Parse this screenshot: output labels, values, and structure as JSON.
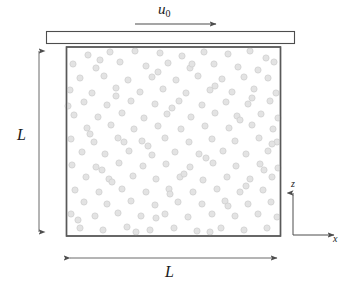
{
  "figure": {
    "labels": {
      "velocity_symbol": "u",
      "velocity_subscript": "0",
      "height_label": "L",
      "width_label": "L",
      "z_axis_label": "z",
      "x_axis_label": "x"
    },
    "colors": {
      "line": "#4d4d4d",
      "box_border": "#595959",
      "plate_border": "#4d4d4d",
      "plate_fill": "#ffffff",
      "particle_fill": "#e3e3e3",
      "particle_stroke": "#cfcfcf",
      "background": "#ffffff",
      "text": "#1a1a1a"
    },
    "geometry": {
      "box": {
        "x": 66,
        "y": 47,
        "width": 215,
        "height": 189
      },
      "plate": {
        "x": 46,
        "y": 31,
        "width": 249,
        "height": 13
      },
      "velocity_arrow": {
        "x1": 135,
        "y1": 24,
        "x2": 219,
        "y2": 24
      },
      "height_dimension": {
        "x": 39,
        "y1": 47,
        "y2": 236
      },
      "width_dimension": {
        "y": 258,
        "x1": 66,
        "x2": 281
      },
      "axes_origin": {
        "x": 293,
        "y": 235
      },
      "axes_z_tip": {
        "x": 293,
        "y": 190
      },
      "axes_x_tip": {
        "x": 337,
        "y": 235
      }
    },
    "particles": {
      "radius": 3.1,
      "count": 168,
      "points": [
        [
          88,
          55
        ],
        [
          110,
          52
        ],
        [
          135,
          51
        ],
        [
          160,
          53
        ],
        [
          182,
          56
        ],
        [
          204,
          52
        ],
        [
          228,
          54
        ],
        [
          250,
          51
        ],
        [
          266,
          58
        ],
        [
          73,
          64
        ],
        [
          96,
          68
        ],
        [
          120,
          62
        ],
        [
          146,
          66
        ],
        [
          168,
          63
        ],
        [
          190,
          68
        ],
        [
          214,
          64
        ],
        [
          238,
          67
        ],
        [
          258,
          70
        ],
        [
          274,
          62
        ],
        [
          80,
          78
        ],
        [
          104,
          76
        ],
        [
          128,
          80
        ],
        [
          152,
          77
        ],
        [
          176,
          80
        ],
        [
          198,
          76
        ],
        [
          222,
          79
        ],
        [
          244,
          77
        ],
        [
          268,
          78
        ],
        [
          70,
          90
        ],
        [
          92,
          93
        ],
        [
          116,
          88
        ],
        [
          140,
          92
        ],
        [
          163,
          89
        ],
        [
          186,
          93
        ],
        [
          210,
          90
        ],
        [
          232,
          92
        ],
        [
          254,
          89
        ],
        [
          276,
          93
        ],
        [
          84,
          102
        ],
        [
          107,
          105
        ],
        [
          131,
          101
        ],
        [
          155,
          104
        ],
        [
          179,
          101
        ],
        [
          202,
          105
        ],
        [
          226,
          102
        ],
        [
          248,
          104
        ],
        [
          270,
          101
        ],
        [
          74,
          115
        ],
        [
          98,
          117
        ],
        [
          122,
          113
        ],
        [
          144,
          118
        ],
        [
          167,
          114
        ],
        [
          191,
          117
        ],
        [
          215,
          113
        ],
        [
          237,
          116
        ],
        [
          261,
          114
        ],
        [
          278,
          118
        ],
        [
          87,
          128
        ],
        [
          111,
          125
        ],
        [
          134,
          129
        ],
        [
          158,
          126
        ],
        [
          181,
          129
        ],
        [
          205,
          126
        ],
        [
          229,
          128
        ],
        [
          252,
          125
        ],
        [
          273,
          129
        ],
        [
          71,
          139
        ],
        [
          94,
          142
        ],
        [
          118,
          138
        ],
        [
          142,
          141
        ],
        [
          165,
          138
        ],
        [
          189,
          142
        ],
        [
          212,
          139
        ],
        [
          235,
          141
        ],
        [
          259,
          138
        ],
        [
          277,
          142
        ],
        [
          82,
          152
        ],
        [
          105,
          154
        ],
        [
          129,
          151
        ],
        [
          152,
          155
        ],
        [
          175,
          152
        ],
        [
          199,
          154
        ],
        [
          223,
          151
        ],
        [
          246,
          154
        ],
        [
          268,
          151
        ],
        [
          72,
          165
        ],
        [
          96,
          167
        ],
        [
          119,
          163
        ],
        [
          143,
          166
        ],
        [
          166,
          164
        ],
        [
          190,
          167
        ],
        [
          213,
          163
        ],
        [
          236,
          166
        ],
        [
          260,
          164
        ],
        [
          278,
          168
        ],
        [
          86,
          177
        ],
        [
          109,
          179
        ],
        [
          133,
          176
        ],
        [
          156,
          179
        ],
        [
          180,
          177
        ],
        [
          203,
          180
        ],
        [
          227,
          177
        ],
        [
          250,
          179
        ],
        [
          272,
          177
        ],
        [
          75,
          190
        ],
        [
          99,
          192
        ],
        [
          122,
          189
        ],
        [
          146,
          192
        ],
        [
          169,
          189
        ],
        [
          193,
          192
        ],
        [
          217,
          189
        ],
        [
          240,
          192
        ],
        [
          263,
          190
        ],
        [
          84,
          202
        ],
        [
          107,
          204
        ],
        [
          131,
          201
        ],
        [
          155,
          205
        ],
        [
          178,
          202
        ],
        [
          202,
          204
        ],
        [
          225,
          201
        ],
        [
          248,
          204
        ],
        [
          271,
          202
        ],
        [
          71,
          214
        ],
        [
          95,
          216
        ],
        [
          118,
          213
        ],
        [
          141,
          216
        ],
        [
          165,
          214
        ],
        [
          188,
          217
        ],
        [
          212,
          214
        ],
        [
          235,
          216
        ],
        [
          258,
          214
        ],
        [
          277,
          217
        ],
        [
          80,
          228
        ],
        [
          103,
          230
        ],
        [
          127,
          227
        ],
        [
          150,
          230
        ],
        [
          174,
          228
        ],
        [
          197,
          231
        ],
        [
          221,
          228
        ],
        [
          244,
          230
        ],
        [
          267,
          228
        ],
        [
          100,
          60
        ],
        [
          158,
          72
        ],
        [
          215,
          86
        ],
        [
          116,
          96
        ],
        [
          172,
          108
        ],
        [
          240,
          120
        ],
        [
          90,
          134
        ],
        [
          148,
          146
        ],
        [
          206,
          158
        ],
        [
          264,
          170
        ],
        [
          112,
          182
        ],
        [
          170,
          194
        ],
        [
          228,
          206
        ],
        [
          78,
          220
        ],
        [
          136,
          232
        ],
        [
          192,
          64
        ],
        [
          252,
          98
        ],
        [
          124,
          142
        ],
        [
          184,
          174
        ],
        [
          246,
          186
        ],
        [
          68,
          106
        ],
        [
          156,
          218
        ],
        [
          210,
          232
        ],
        [
          272,
          144
        ],
        [
          102,
          170
        ]
      ]
    }
  }
}
